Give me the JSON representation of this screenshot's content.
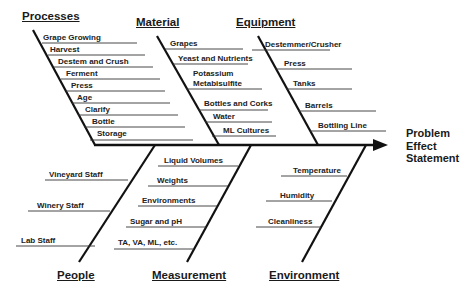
{
  "effect": {
    "lines": [
      "Problem",
      "Effect",
      "Statement"
    ]
  },
  "categories": {
    "processes": {
      "label": "Processes",
      "causes": [
        "Grape Growing",
        "Harvest",
        "Destem and Crush",
        "Ferment",
        "Press",
        "Age",
        "Clarify",
        "Bottle",
        "Storage"
      ]
    },
    "material": {
      "label": "Material",
      "causes": [
        "Grapes",
        "Yeast and Nutrients",
        "Potassium",
        "Metabisulfite",
        "Bottles and Corks",
        "Water",
        "ML Cultures"
      ]
    },
    "equipment": {
      "label": "Equipment",
      "causes": [
        "Destemmer/Crusher",
        "Press",
        "Tanks",
        "Barrels",
        "Bottling Line"
      ]
    },
    "people": {
      "label": "People",
      "causes": [
        "Vineyard Staff",
        "Winery Staff",
        "Lab Staff"
      ]
    },
    "measurement": {
      "label": "Measurement",
      "causes": [
        "Liquid Volumes",
        "Weights",
        "Environments",
        "Sugar and pH",
        "TA, VA, ML, etc."
      ]
    },
    "environment": {
      "label": "Environment",
      "causes": [
        "Temperature",
        "Humidity",
        "Cleanliness"
      ]
    }
  },
  "colors": {
    "line": "#111111",
    "text": "#1a1a1a",
    "background": "#ffffff"
  }
}
